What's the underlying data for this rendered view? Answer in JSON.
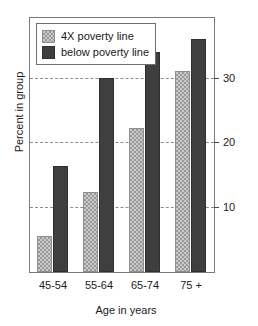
{
  "chart_data": {
    "type": "bar",
    "title": "",
    "subtitle": "",
    "xlabel": "Age in years",
    "ylabel": "Percent in group",
    "categories": [
      "45-54",
      "55-64",
      "65-74",
      "75 +"
    ],
    "series": [
      {
        "name": "4X poverty line",
        "values": [
          5.5,
          12.3,
          22.2,
          31.0
        ],
        "color": "#c9c9c9",
        "pattern": "checker-hatch"
      },
      {
        "name": "below poverty line",
        "values": [
          16.3,
          30.0,
          34.0,
          36.0
        ],
        "color": "#3f3f3f",
        "pattern": "solid"
      }
    ],
    "ylim": [
      0,
      39.2
    ],
    "yticks": [
      10,
      20,
      30
    ],
    "ytick_labels": [
      "10",
      "20",
      "30"
    ],
    "grid": "horizontal-dashed",
    "grid_color": "#8d8d8d",
    "legend_position": "top-left-inside",
    "axis_color": "#7a7a7a",
    "tick_label_side": "right"
  },
  "legend": {
    "items": [
      {
        "label": "4X poverty line",
        "swatch": "light-hatched-swatch"
      },
      {
        "label": "below poverty line",
        "swatch": "dark-solid-swatch"
      }
    ]
  }
}
